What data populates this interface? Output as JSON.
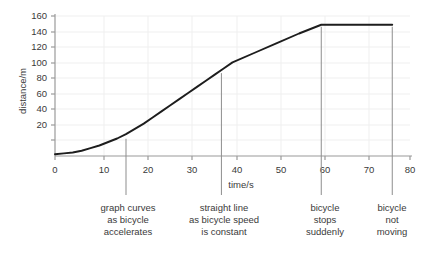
{
  "chart_data": {
    "type": "line",
    "title": "",
    "subtitle": "",
    "xlabel": "time/s",
    "ylabel": "distance/m",
    "xlim": [
      0,
      80
    ],
    "ylim": [
      0,
      160
    ],
    "xticks": [
      0,
      10,
      20,
      30,
      40,
      50,
      60,
      70,
      80
    ],
    "xtick_labels": [
      "0",
      "10",
      "20",
      "30",
      "40",
      "50",
      "60",
      "70",
      "80"
    ],
    "yticks": [
      20,
      40,
      60,
      80,
      100,
      120,
      140,
      160
    ],
    "ytick_labels": [
      "20",
      "40",
      "60",
      "80",
      "100",
      "120",
      "140",
      "160"
    ],
    "grid": true,
    "legend": "none",
    "line_color": "#1d1d1d",
    "grid_color": "#ededed",
    "axis_color": "#9a9a9a",
    "annotation_line_color": "#8d8d8d",
    "series": [
      {
        "name": "distance-time",
        "x": [
          0,
          2,
          4,
          6,
          8,
          10,
          12,
          14,
          16,
          18,
          20,
          22,
          24,
          26,
          28,
          30,
          32,
          34,
          36,
          38,
          40,
          45,
          50,
          55,
          60,
          65,
          70,
          76
        ],
        "y": [
          2,
          3,
          4,
          6,
          9,
          12,
          16,
          20,
          25,
          31,
          37,
          44,
          51,
          58,
          65,
          72,
          79,
          86,
          93,
          100,
          107,
          118,
          129,
          140,
          150,
          150,
          150,
          150
        ]
      }
    ],
    "annotations": [
      {
        "id": "accelerating",
        "x_value": 16,
        "line_top_y_value": 22,
        "lines": [
          "graph curves",
          "as bicycle",
          "accelerates"
        ]
      },
      {
        "id": "constant-speed",
        "x_value": 37.5,
        "line_top_y_value": 97,
        "lines": [
          "straight line",
          "as bicycle speed",
          "is constant"
        ]
      },
      {
        "id": "stops-suddenly",
        "x_value": 60,
        "line_top_y_value": 150,
        "lines": [
          "bicycle",
          "stops",
          "suddenly"
        ]
      },
      {
        "id": "not-moving",
        "x_value": 76,
        "line_top_y_value": 150,
        "lines": [
          "bicycle",
          "not",
          "moving"
        ]
      }
    ]
  }
}
